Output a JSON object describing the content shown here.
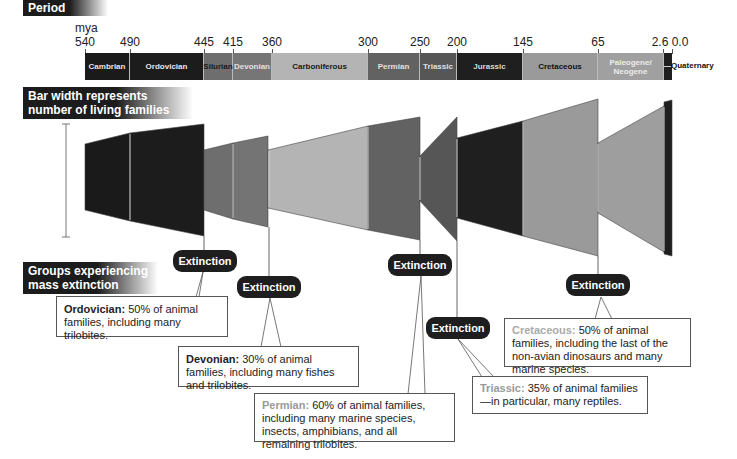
{
  "headers": {
    "period": "Period",
    "bar_width": [
      "Bar width represents",
      "number of living families"
    ],
    "groups": [
      "Groups experiencing",
      "mass extinction"
    ]
  },
  "axis": {
    "unit": "mya",
    "ticks": [
      {
        "label": "540",
        "x": 85
      },
      {
        "label": "490",
        "x": 130
      },
      {
        "label": "445",
        "x": 204
      },
      {
        "label": "415",
        "x": 233
      },
      {
        "label": "360",
        "x": 272
      },
      {
        "label": "300",
        "x": 368
      },
      {
        "label": "250",
        "x": 420
      },
      {
        "label": "200",
        "x": 457
      },
      {
        "label": "145",
        "x": 523
      },
      {
        "label": "65",
        "x": 598
      },
      {
        "label": "2.6",
        "x": 663
      },
      {
        "label": "0.0",
        "x": 673
      }
    ]
  },
  "periods": [
    {
      "name": "Cambrian",
      "x0": 85,
      "x1": 130,
      "color": "#1a1a1a",
      "text": "#e6e6e6"
    },
    {
      "name": "Ordovician",
      "x0": 130,
      "x1": 204,
      "color": "#1c1c1c",
      "text": "#e6e6e6"
    },
    {
      "name": "Silurian",
      "x0": 204,
      "x1": 233,
      "color": "#6e6e6e",
      "text": "#1a1a1a"
    },
    {
      "name": "Devonian",
      "x0": 233,
      "x1": 272,
      "color": "#767676",
      "text": "#e0e0e0"
    },
    {
      "name": "Carboniferous",
      "x0": 272,
      "x1": 368,
      "color": "#b4b4b4",
      "text": "#1a1a1a"
    },
    {
      "name": "Permian",
      "x0": 368,
      "x1": 420,
      "color": "#626262",
      "text": "#e0e0e0"
    },
    {
      "name": "Triassic",
      "x0": 420,
      "x1": 457,
      "color": "#565656",
      "text": "#e0e0e0"
    },
    {
      "name": "Jurassic",
      "x0": 457,
      "x1": 523,
      "color": "#1f1f1f",
      "text": "#d8d8d8"
    },
    {
      "name": "Cretaceous",
      "x0": 523,
      "x1": 598,
      "color": "#9a9a9a",
      "text": "#111111"
    },
    {
      "name": "Paleogene/ Neogene",
      "x0": 598,
      "x1": 664,
      "color": "#a0a0a0",
      "text": "#ececec"
    },
    {
      "name": "",
      "x0": 664,
      "x1": 672,
      "color": "#1f1f1f",
      "text": "#ffffff"
    }
  ],
  "quaternary_label": "Quaternary",
  "extinctions": [
    {
      "label": "Extinction",
      "name": "Ordovician:",
      "name_gray": false,
      "text": " 50% of animal families, including many trilobites."
    },
    {
      "label": "Extinction",
      "name": "Devonian:",
      "name_gray": false,
      "text": " 30% of animal families, including many fishes and trilobites."
    },
    {
      "label": "Extinction",
      "name": "Permian:",
      "name_gray": true,
      "text": " 60% of animal families, including many marine species, insects, amphibians, and all remaining trilobites."
    },
    {
      "label": "Extinction",
      "name": "Triassic:",
      "name_gray": true,
      "text": " 35% of animal families—in particular, many reptiles."
    },
    {
      "label": "Extinction",
      "name": "Cretaceous:",
      "name_gray": true,
      "text": " 50% of animal families, including the last of the non-avian dinosaurs and many marine species."
    }
  ]
}
